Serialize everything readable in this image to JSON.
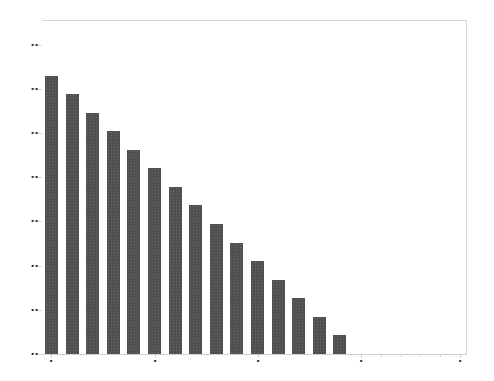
{
  "chart_data": {
    "type": "bar",
    "title": "",
    "xlabel": "",
    "ylabel": "",
    "note": "Tick labels are illegible in the source image; values are expressed in y-tick interval units (8 evenly spaced ticks, index 0 to 7).",
    "categories": [
      "1",
      "2",
      "3",
      "4",
      "5",
      "6",
      "7",
      "8",
      "9",
      "10",
      "11",
      "12",
      "13",
      "14",
      "15"
    ],
    "values": [
      6.3,
      5.88,
      5.46,
      5.04,
      4.62,
      4.2,
      3.78,
      3.36,
      2.94,
      2.52,
      2.1,
      1.68,
      1.26,
      0.84,
      0.42
    ],
    "ylim": [
      0,
      7.2
    ],
    "y_ticks": [
      0,
      1,
      2,
      3,
      4,
      5,
      6,
      7
    ],
    "x_major_ticks": 5,
    "grid": false,
    "legend": null,
    "bar_color": "#505050"
  }
}
